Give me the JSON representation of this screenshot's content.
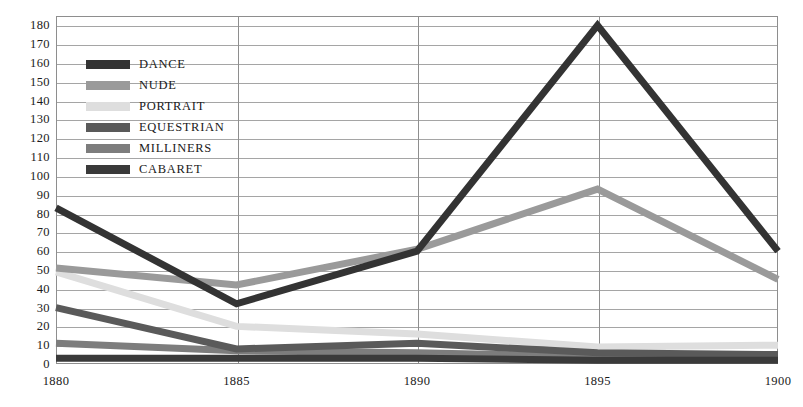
{
  "chart_data": {
    "type": "line",
    "title": "",
    "xlabel": "",
    "ylabel": "",
    "x": [
      1880,
      1885,
      1890,
      1895,
      1900
    ],
    "categories": [
      "1880",
      "1885",
      "1890",
      "1895",
      "1900"
    ],
    "ylim": [
      0,
      185
    ],
    "yticks": [
      0,
      10,
      20,
      30,
      40,
      50,
      60,
      70,
      80,
      90,
      100,
      110,
      120,
      130,
      140,
      150,
      160,
      170,
      180
    ],
    "ytick_labels": [
      "0",
      "10",
      "20",
      "30",
      "40",
      "50",
      "60",
      "70",
      "80",
      "90",
      "100",
      "110",
      "120",
      "130",
      "140",
      "150",
      "160",
      "170",
      "180"
    ],
    "grid": true,
    "legend_position": "upper-left-inside",
    "series": [
      {
        "name": "DANCE",
        "color": "#333333",
        "values": [
          83,
          32,
          60,
          180,
          60
        ]
      },
      {
        "name": "NUDE",
        "color": "#9a9a9a",
        "values": [
          51,
          42,
          61,
          93,
          45
        ]
      },
      {
        "name": "PORTRAIT",
        "color": "#dedede",
        "values": [
          49,
          20,
          16,
          9,
          10
        ]
      },
      {
        "name": "EQUESTRIAN",
        "color": "#5a5a5a",
        "values": [
          30,
          8,
          11,
          6,
          5
        ]
      },
      {
        "name": "MILLINERS",
        "color": "#7d7d7d",
        "values": [
          11,
          7,
          6,
          4,
          3
        ]
      },
      {
        "name": "CABARET",
        "color": "#3a3a3a",
        "values": [
          3,
          3,
          3,
          2,
          2
        ]
      }
    ]
  },
  "axis": {
    "x_labels": [
      "1880",
      "1885",
      "1890",
      "1895",
      "1900"
    ],
    "y_labels": [
      "180",
      "170",
      "160",
      "150",
      "140",
      "130",
      "120",
      "110",
      "100",
      "90",
      "80",
      "70",
      "60",
      "50",
      "40",
      "30",
      "20",
      "10",
      "0"
    ]
  },
  "legend": {
    "items": [
      {
        "label": "DANCE"
      },
      {
        "label": "NUDE"
      },
      {
        "label": "PORTRAIT"
      },
      {
        "label": "EQUESTRIAN"
      },
      {
        "label": "MILLINERS"
      },
      {
        "label": "CABARET"
      }
    ]
  },
  "colors": {
    "dance": "#333333",
    "nude": "#9a9a9a",
    "portrait": "#dedede",
    "equestrian": "#5a5a5a",
    "milliners": "#7d7d7d",
    "cabaret": "#3a3a3a",
    "grid": "#a5a5a5",
    "frame": "#8e8e8e",
    "background": "#ffffff"
  }
}
